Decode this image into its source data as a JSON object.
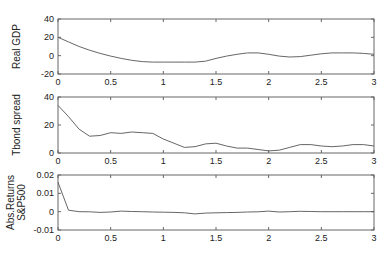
{
  "chart_data": [
    {
      "type": "line",
      "title": "",
      "xlabel": "",
      "ylabel": "Real GDP",
      "xlim": [
        0,
        3
      ],
      "ylim": [
        -20,
        40
      ],
      "xticks": [
        "0",
        "0.5",
        "1",
        "1.5",
        "2",
        "2.5",
        "3"
      ],
      "yticks": [
        "-20",
        "0",
        "20",
        "40"
      ],
      "grid": false,
      "series": [
        {
          "name": "Real GDP",
          "x": [
            0,
            0.1,
            0.2,
            0.3,
            0.4,
            0.5,
            0.6,
            0.7,
            0.8,
            0.9,
            1.0,
            1.1,
            1.2,
            1.3,
            1.4,
            1.5,
            1.6,
            1.7,
            1.8,
            1.9,
            2.0,
            2.1,
            2.2,
            2.3,
            2.4,
            2.5,
            2.6,
            2.7,
            2.8,
            2.9,
            3.0
          ],
          "y": [
            20,
            15,
            10,
            6,
            2.5,
            -0.5,
            -3,
            -5,
            -6.5,
            -7,
            -7,
            -7,
            -7,
            -7,
            -6,
            -3,
            -0.5,
            1.5,
            3,
            3,
            1.5,
            -0.5,
            -1.5,
            -1,
            0.5,
            2,
            3,
            3,
            3,
            2.5,
            1.5
          ]
        }
      ]
    },
    {
      "type": "line",
      "title": "",
      "xlabel": "",
      "ylabel": "Tbond spread",
      "xlim": [
        0,
        3
      ],
      "ylim": [
        0,
        40
      ],
      "xticks": [
        "0",
        "0.5",
        "1",
        "1.5",
        "2",
        "2.5",
        "3"
      ],
      "yticks": [
        "0",
        "20",
        "40"
      ],
      "grid": false,
      "series": [
        {
          "name": "Tbond spread",
          "x": [
            0,
            0.1,
            0.2,
            0.3,
            0.4,
            0.5,
            0.6,
            0.7,
            0.8,
            0.9,
            1.0,
            1.1,
            1.2,
            1.3,
            1.4,
            1.5,
            1.6,
            1.7,
            1.8,
            1.9,
            2.0,
            2.1,
            2.2,
            2.3,
            2.4,
            2.5,
            2.6,
            2.7,
            2.8,
            2.9,
            3.0
          ],
          "y": [
            34,
            26,
            17,
            12,
            12.5,
            14.5,
            14,
            15,
            14.5,
            14,
            10,
            7,
            4,
            4.5,
            6.5,
            7,
            5,
            3.5,
            3.5,
            2.5,
            1.5,
            2,
            4,
            6,
            6,
            5,
            4.5,
            5,
            6,
            6,
            5
          ]
        }
      ]
    },
    {
      "type": "line",
      "title": "",
      "xlabel": "",
      "ylabel": "Abs.Returns S&P500",
      "xlim": [
        0,
        3
      ],
      "ylim": [
        -0.01,
        0.02
      ],
      "xticks": [
        "0",
        "0.5",
        "1",
        "1.5",
        "2",
        "2.5",
        "3"
      ],
      "yticks": [
        "-0.01",
        "0",
        "0.01",
        "0.02"
      ],
      "grid": false,
      "series": [
        {
          "name": "Abs.Returns S&P500",
          "x": [
            0,
            0.1,
            0.2,
            0.3,
            0.4,
            0.5,
            0.6,
            0.7,
            0.8,
            0.9,
            1.0,
            1.1,
            1.2,
            1.3,
            1.4,
            1.5,
            1.6,
            1.7,
            1.8,
            1.9,
            2.0,
            2.1,
            2.2,
            2.3,
            2.4,
            2.5,
            2.6,
            2.7,
            2.8,
            2.9,
            3.0
          ],
          "y": [
            0.016,
            0.0008,
            0.0,
            -0.0001,
            -0.0004,
            -0.0002,
            0.0003,
            0.0001,
            0.0,
            -0.0002,
            -0.0003,
            -0.0004,
            -0.0006,
            -0.0012,
            -0.0008,
            -0.0006,
            -0.0005,
            -0.0004,
            -0.0002,
            -0.0001,
            0.0003,
            -0.0002,
            0.0,
            0.0002,
            0.0001,
            0.0,
            0.0,
            0.0,
            0.0,
            0.0,
            0.0
          ]
        }
      ]
    }
  ],
  "style": {
    "line_color": "#555555",
    "axis_color": "#666666",
    "text_color": "#222222"
  }
}
